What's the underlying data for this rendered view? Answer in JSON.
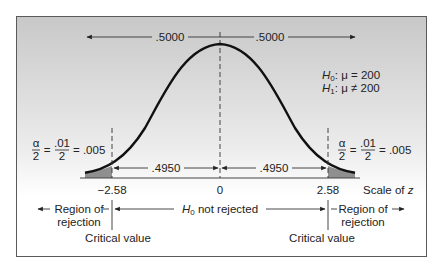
{
  "diagram": {
    "type": "two-tailed-hypothesis-test-normal-curve",
    "top_area_left": ".5000",
    "top_area_right": ".5000",
    "hypotheses": {
      "null_prefix": "H",
      "null_sub": "0",
      "null_body": ": μ = 200",
      "alt_prefix": "H",
      "alt_sub": "1",
      "alt_body": ": μ ≠ 200"
    },
    "tail_left": {
      "alpha_num": "α",
      "alpha_den": "2",
      "eq1": "=",
      "frac_num": ".01",
      "frac_den": "2",
      "eq2": "= .005"
    },
    "tail_right": {
      "alpha_num": "α",
      "alpha_den": "2",
      "eq1": "=",
      "frac_num": ".01",
      "frac_den": "2",
      "eq2": "= .005"
    },
    "inner_area_left": ".4950",
    "inner_area_right": ".4950",
    "z_ticks": {
      "left": "−2.58",
      "center": "0",
      "right": "2.58"
    },
    "scale_label_prefix": "Scale of ",
    "scale_label_var": "z",
    "region_left": {
      "line1": "Region of",
      "line2": "rejection"
    },
    "region_right": {
      "line1": "Region of",
      "line2": "rejection"
    },
    "center_label": {
      "prefix": "H",
      "sub": "0",
      "body": " not rejected"
    },
    "critical_left": "Critical value",
    "critical_right": "Critical value",
    "colors": {
      "frame_top": "#c9c9c9",
      "frame_bottom": "#ffffff",
      "curve": "#111111",
      "tail_fill": "#8f8f8f",
      "frame_border": "#555555"
    }
  }
}
